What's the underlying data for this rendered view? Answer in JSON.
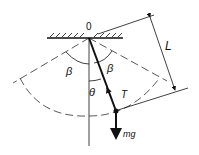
{
  "diagram": {
    "labels": {
      "pivot": "0",
      "length": "L",
      "beta_left": "β",
      "beta_right": "β",
      "theta": "θ",
      "tension": "T",
      "weight": "mg"
    },
    "colors": {
      "ink": "#111111",
      "background": "#ffffff"
    }
  }
}
